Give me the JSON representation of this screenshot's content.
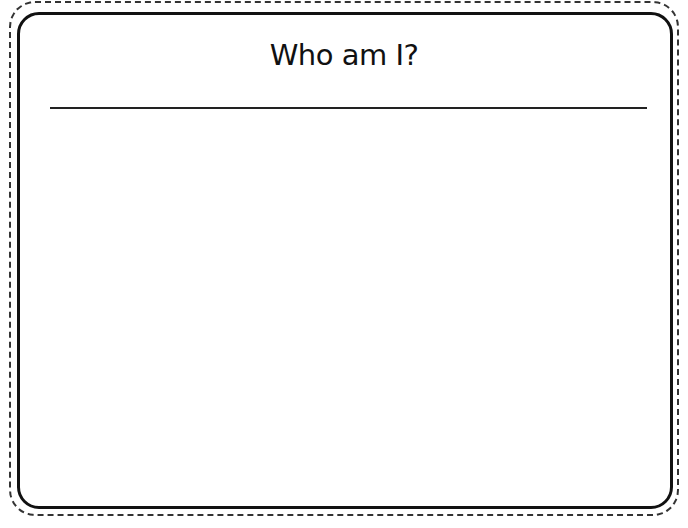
{
  "worksheet": {
    "title": "Who am I?"
  }
}
